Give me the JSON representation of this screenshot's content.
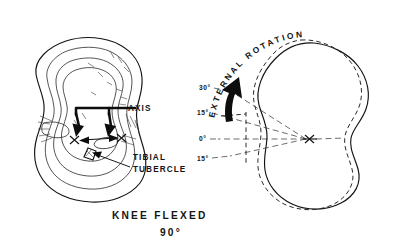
{
  "figure": {
    "background_color": "#ffffff",
    "ink_color": "#131313"
  },
  "left_panel": {
    "name": "tibial-plateau-axis-view",
    "labels": {
      "axis": "AXIS",
      "tibial_tubercle_line1": "TIBIAL",
      "tibial_tubercle_line2": "TUBERCLE"
    }
  },
  "right_panel": {
    "name": "external-rotation-view",
    "curved_label": "EXTERNAL  ROTATION",
    "curved_label_chars": [
      "E",
      "X",
      "T",
      "E",
      "R",
      "N",
      "A",
      "L",
      " ",
      "R",
      "O",
      "T",
      "A",
      "T",
      "I",
      "O",
      "N"
    ],
    "angle_ticks": [
      {
        "label": "30°",
        "value": 30,
        "unit": "degrees"
      },
      {
        "label": "15°",
        "value": 15,
        "unit": "degrees"
      },
      {
        "label": "0°",
        "value": 0,
        "unit": "degrees"
      },
      {
        "label": "15°",
        "value": -15,
        "unit": "degrees"
      }
    ],
    "rotation_arrow": "external-rotation-arrow",
    "outline_solid": "neutral-position-outline",
    "outline_dashed": "rotated-position-outline"
  },
  "caption": {
    "line1": "KNEE  FLEXED",
    "line2": "90°"
  }
}
